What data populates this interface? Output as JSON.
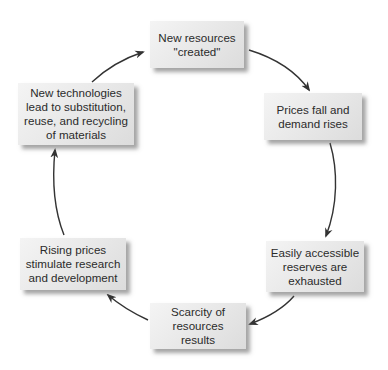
{
  "diagram": {
    "type": "cycle",
    "nodes": [
      {
        "id": "new-resources",
        "label": "New resources\n\"created\""
      },
      {
        "id": "prices-fall",
        "label": "Prices fall and\ndemand rises"
      },
      {
        "id": "reserves-exhausted",
        "label": "Easily accessible\nreserves are\nexhausted"
      },
      {
        "id": "scarcity",
        "label": "Scarcity of\nresources results"
      },
      {
        "id": "rising-prices",
        "label": "Rising prices\nstimulate research\nand development"
      },
      {
        "id": "new-technologies",
        "label": "New technologies\nlead to substitution,\nreuse, and recycling\nof materials"
      }
    ],
    "edges": [
      {
        "from": "new-resources",
        "to": "prices-fall"
      },
      {
        "from": "prices-fall",
        "to": "reserves-exhausted"
      },
      {
        "from": "reserves-exhausted",
        "to": "scarcity"
      },
      {
        "from": "scarcity",
        "to": "rising-prices"
      },
      {
        "from": "rising-prices",
        "to": "new-technologies"
      },
      {
        "from": "new-technologies",
        "to": "new-resources"
      }
    ],
    "colors": {
      "box_fill": "#e8e8e8",
      "arrow": "#333333",
      "text": "#2b2b2b"
    }
  }
}
